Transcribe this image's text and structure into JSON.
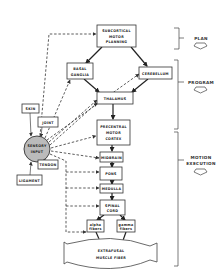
{
  "diagram": {
    "title": "",
    "nodes": {
      "subcortical": [
        "SUBCORTICAL",
        "MOTOR",
        "PLANNING"
      ],
      "basal_ganglia": [
        "BASAL",
        "GANGLIA"
      ],
      "cerebellum": [
        "CEREBELLUM"
      ],
      "thalamus": [
        "THALAMUS"
      ],
      "precentral": [
        "PRECENTRAL",
        "MOTOR",
        "CORTEX"
      ],
      "midbrain": [
        "MIDBRAIN"
      ],
      "pons": [
        "PONS"
      ],
      "medulla": [
        "MEDULLA"
      ],
      "spinal_cord": [
        "SPINAL",
        "CORD"
      ],
      "alpha_fibers": [
        "alpha",
        "fibers"
      ],
      "gamma_fibers": [
        "gamma",
        "fibers"
      ],
      "muscle": [
        "EXTRAFUSAL",
        "MUSCLE FIBER"
      ],
      "sensory_input": [
        "SENSORY",
        "INPUT"
      ],
      "skin": [
        "SKIN"
      ],
      "joint": [
        "JOINT"
      ],
      "tendon": [
        "TENDON"
      ],
      "ligament": [
        "LIGAMENT"
      ]
    },
    "stages": {
      "plan": [
        "PLAN"
      ],
      "program": [
        "PROGRAM"
      ],
      "motion": [
        "MOTION",
        "EXECUTION"
      ]
    }
  }
}
